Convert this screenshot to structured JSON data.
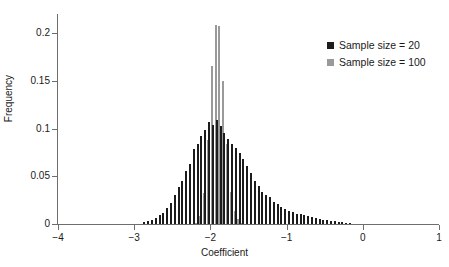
{
  "chart_data": {
    "type": "bar",
    "title": "",
    "xlabel": "Coefficient",
    "ylabel": "Frequency",
    "xlim": [
      -4,
      1
    ],
    "ylim": [
      0,
      0.22
    ],
    "xticks": [
      -4,
      -3,
      -2,
      -1,
      0,
      1
    ],
    "xtick_labels": [
      "−4",
      "−3",
      "−2",
      "−1",
      "0",
      "1"
    ],
    "yticks": [
      0,
      0.05,
      0.1,
      0.15,
      0.2
    ],
    "ytick_labels": [
      "0",
      "0.05",
      "0.1",
      "0.15",
      "0.2"
    ],
    "grid": false,
    "legend_position": "top-right",
    "bin_width": 0.05,
    "x": [
      -2.85,
      -2.8,
      -2.75,
      -2.7,
      -2.65,
      -2.6,
      -2.55,
      -2.5,
      -2.45,
      -2.4,
      -2.35,
      -2.3,
      -2.25,
      -2.2,
      -2.15,
      -2.1,
      -2.05,
      -2.0,
      -1.95,
      -1.9,
      -1.85,
      -1.8,
      -1.75,
      -1.7,
      -1.65,
      -1.6,
      -1.55,
      -1.5,
      -1.45,
      -1.4,
      -1.35,
      -1.3,
      -1.25,
      -1.2,
      -1.15,
      -1.1,
      -1.05,
      -1.0,
      -0.95,
      -0.9,
      -0.85,
      -0.8,
      -0.75,
      -0.7,
      -0.65,
      -0.6,
      -0.55,
      -0.5,
      -0.45,
      -0.4,
      -0.35,
      -0.3,
      -0.25,
      -0.2,
      -0.15
    ],
    "series": [
      {
        "name": "Sample size = 20",
        "color": "#1c1c1c",
        "values": [
          0.002,
          0.003,
          0.004,
          0.006,
          0.009,
          0.012,
          0.017,
          0.022,
          0.03,
          0.039,
          0.045,
          0.056,
          0.063,
          0.079,
          0.084,
          0.092,
          0.098,
          0.107,
          0.104,
          0.109,
          0.103,
          0.095,
          0.089,
          0.084,
          0.08,
          0.074,
          0.068,
          0.061,
          0.053,
          0.045,
          0.04,
          0.034,
          0.03,
          0.028,
          0.023,
          0.021,
          0.018,
          0.016,
          0.014,
          0.013,
          0.011,
          0.01,
          0.009,
          0.008,
          0.007,
          0.006,
          0.005,
          0.004,
          0.004,
          0.003,
          0.003,
          0.002,
          0.002,
          0.001,
          0.001
        ]
      },
      {
        "name": "Sample size = 100",
        "color": "#9a9a9a",
        "values": [
          0.0,
          0.0,
          0.0,
          0.0,
          0.0,
          0.0,
          0.0,
          0.0,
          0.0,
          0.0,
          0.0,
          0.0,
          0.0,
          0.001,
          0.008,
          0.033,
          0.088,
          0.166,
          0.209,
          0.207,
          0.15,
          0.084,
          0.034,
          0.014,
          0.005,
          0.001,
          0.0,
          0.0,
          0.0,
          0.0,
          0.0,
          0.0,
          0.0,
          0.0,
          0.0,
          0.0,
          0.0,
          0.0,
          0.0,
          0.0,
          0.0,
          0.0,
          0.0,
          0.0,
          0.0,
          0.0,
          0.0,
          0.0,
          0.0,
          0.0,
          0.0,
          0.0,
          0.0,
          0.0,
          0.0
        ]
      }
    ],
    "legend": [
      "Sample size = 20",
      "Sample size = 100"
    ]
  },
  "legend": {
    "items": [
      {
        "label": "Sample size = 20",
        "swatch": "legend-swatch-black"
      },
      {
        "label": "Sample size = 100",
        "swatch": "legend-swatch-gray"
      }
    ]
  },
  "axes": {
    "x_title": "Coefficient",
    "y_title": "Frequency"
  }
}
